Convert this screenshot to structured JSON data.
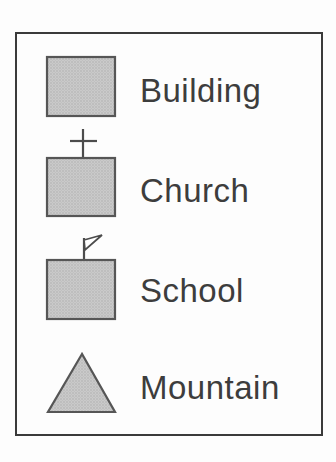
{
  "legend": {
    "items": [
      {
        "label": "Building",
        "symbol": "building-square"
      },
      {
        "label": "Church",
        "symbol": "church-square-with-cross"
      },
      {
        "label": "School",
        "symbol": "school-square-with-flag"
      },
      {
        "label": "Mountain",
        "symbol": "mountain-triangle"
      }
    ],
    "colors": {
      "symbol_fill": "#cacaca",
      "symbol_dot": "#a9a9a9",
      "symbol_stroke": "#565656",
      "label_text": "#3d3d3d",
      "box_border": "#3a3a3a",
      "background": "#fdfdfd"
    }
  }
}
